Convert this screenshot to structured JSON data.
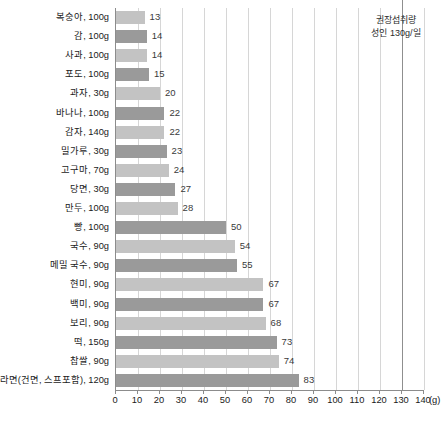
{
  "chart_data": {
    "type": "bar",
    "orientation": "horizontal",
    "title": "",
    "xlabel": "(g)",
    "ylabel": "",
    "xlim": [
      0,
      140
    ],
    "xticks": [
      0,
      10,
      20,
      30,
      40,
      50,
      60,
      70,
      80,
      90,
      100,
      110,
      120,
      130,
      140
    ],
    "unit": "(g)",
    "grid": true,
    "legend": "none",
    "categories": [
      "복숭아, 100g",
      "감, 100g",
      "사과, 100g",
      "포도, 100g",
      "과자, 30g",
      "바나나, 100g",
      "감자, 140g",
      "밀가루, 30g",
      "고구마, 70g",
      "당면, 30g",
      "만두, 100g",
      "빵, 100g",
      "국수, 90g",
      "메밀 국수, 90g",
      "현미, 90g",
      "백미, 90g",
      "보리, 90g",
      "떡, 150g",
      "찹쌀, 90g",
      "라면(건면, 스프포함), 120g"
    ],
    "values": [
      13,
      14,
      14,
      15,
      20,
      22,
      22,
      23,
      24,
      27,
      28,
      50,
      54,
      55,
      67,
      67,
      68,
      73,
      74,
      83
    ],
    "annotations": [
      {
        "name": "recommended-intake",
        "line_1": "권장섭취량",
        "line_2": "성인 130g/일",
        "value": 130
      }
    ],
    "colors": {
      "bar_light": "#c3c3c3",
      "bar_dark": "#9a9a9a",
      "gridline": "#d6d6d6",
      "axis": "#8c8c8c",
      "reference_line": "#8f8f8f",
      "text": "#1a1a1a"
    }
  }
}
